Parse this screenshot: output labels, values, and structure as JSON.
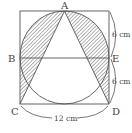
{
  "diagram": {
    "type": "geometry-figure",
    "points": {
      "A": "A",
      "B": "B",
      "C": "C",
      "D": "D",
      "E": "E"
    },
    "dimensions": {
      "upper_right": "6 cm",
      "lower_right": "6 cm",
      "bottom": "12 cm"
    },
    "shapes": [
      "square",
      "circle",
      "triangle ACD",
      "segment BE"
    ],
    "shading": "hatched",
    "colors": {
      "stroke": "#555555",
      "hatch": "#555555",
      "background": "#ffffff"
    }
  }
}
